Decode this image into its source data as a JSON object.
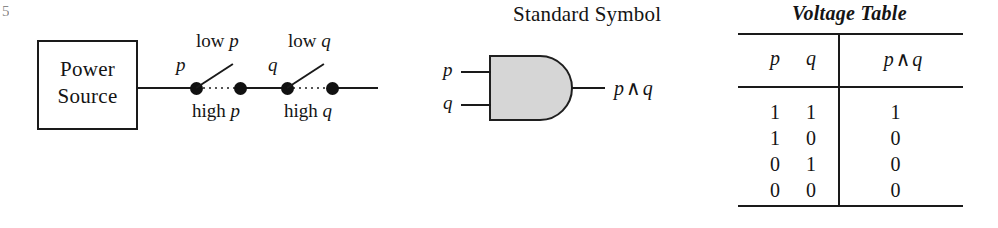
{
  "figure": {
    "edge_artifact": "5"
  },
  "circuit": {
    "source_label_line1": "Power",
    "source_label_line2": "Source",
    "switches": [
      {
        "var": "p",
        "open_label_prefix": "low ",
        "open_label_var": "p",
        "closed_label_prefix": "high ",
        "closed_label_var": "p"
      },
      {
        "var": "q",
        "open_label_prefix": "low ",
        "open_label_var": "q",
        "closed_label_prefix": "high ",
        "closed_label_var": "q"
      }
    ]
  },
  "gate": {
    "title": "Standard Symbol",
    "input_top": "p",
    "input_bottom": "q",
    "output_left": "p",
    "output_op": "∧",
    "output_right": "q",
    "fill_color": "#d6d6d6",
    "stroke_color": "#1f1f1f"
  },
  "voltage_table": {
    "title": "Voltage Table",
    "headers": {
      "p": "p",
      "q": "q",
      "result_left": "p",
      "result_op": "∧",
      "result_right": "q"
    },
    "rows": [
      {
        "p": "1",
        "q": "1",
        "r": "1"
      },
      {
        "p": "1",
        "q": "0",
        "r": "0"
      },
      {
        "p": "0",
        "q": "1",
        "r": "0"
      },
      {
        "p": "0",
        "q": "0",
        "r": "0"
      }
    ]
  }
}
